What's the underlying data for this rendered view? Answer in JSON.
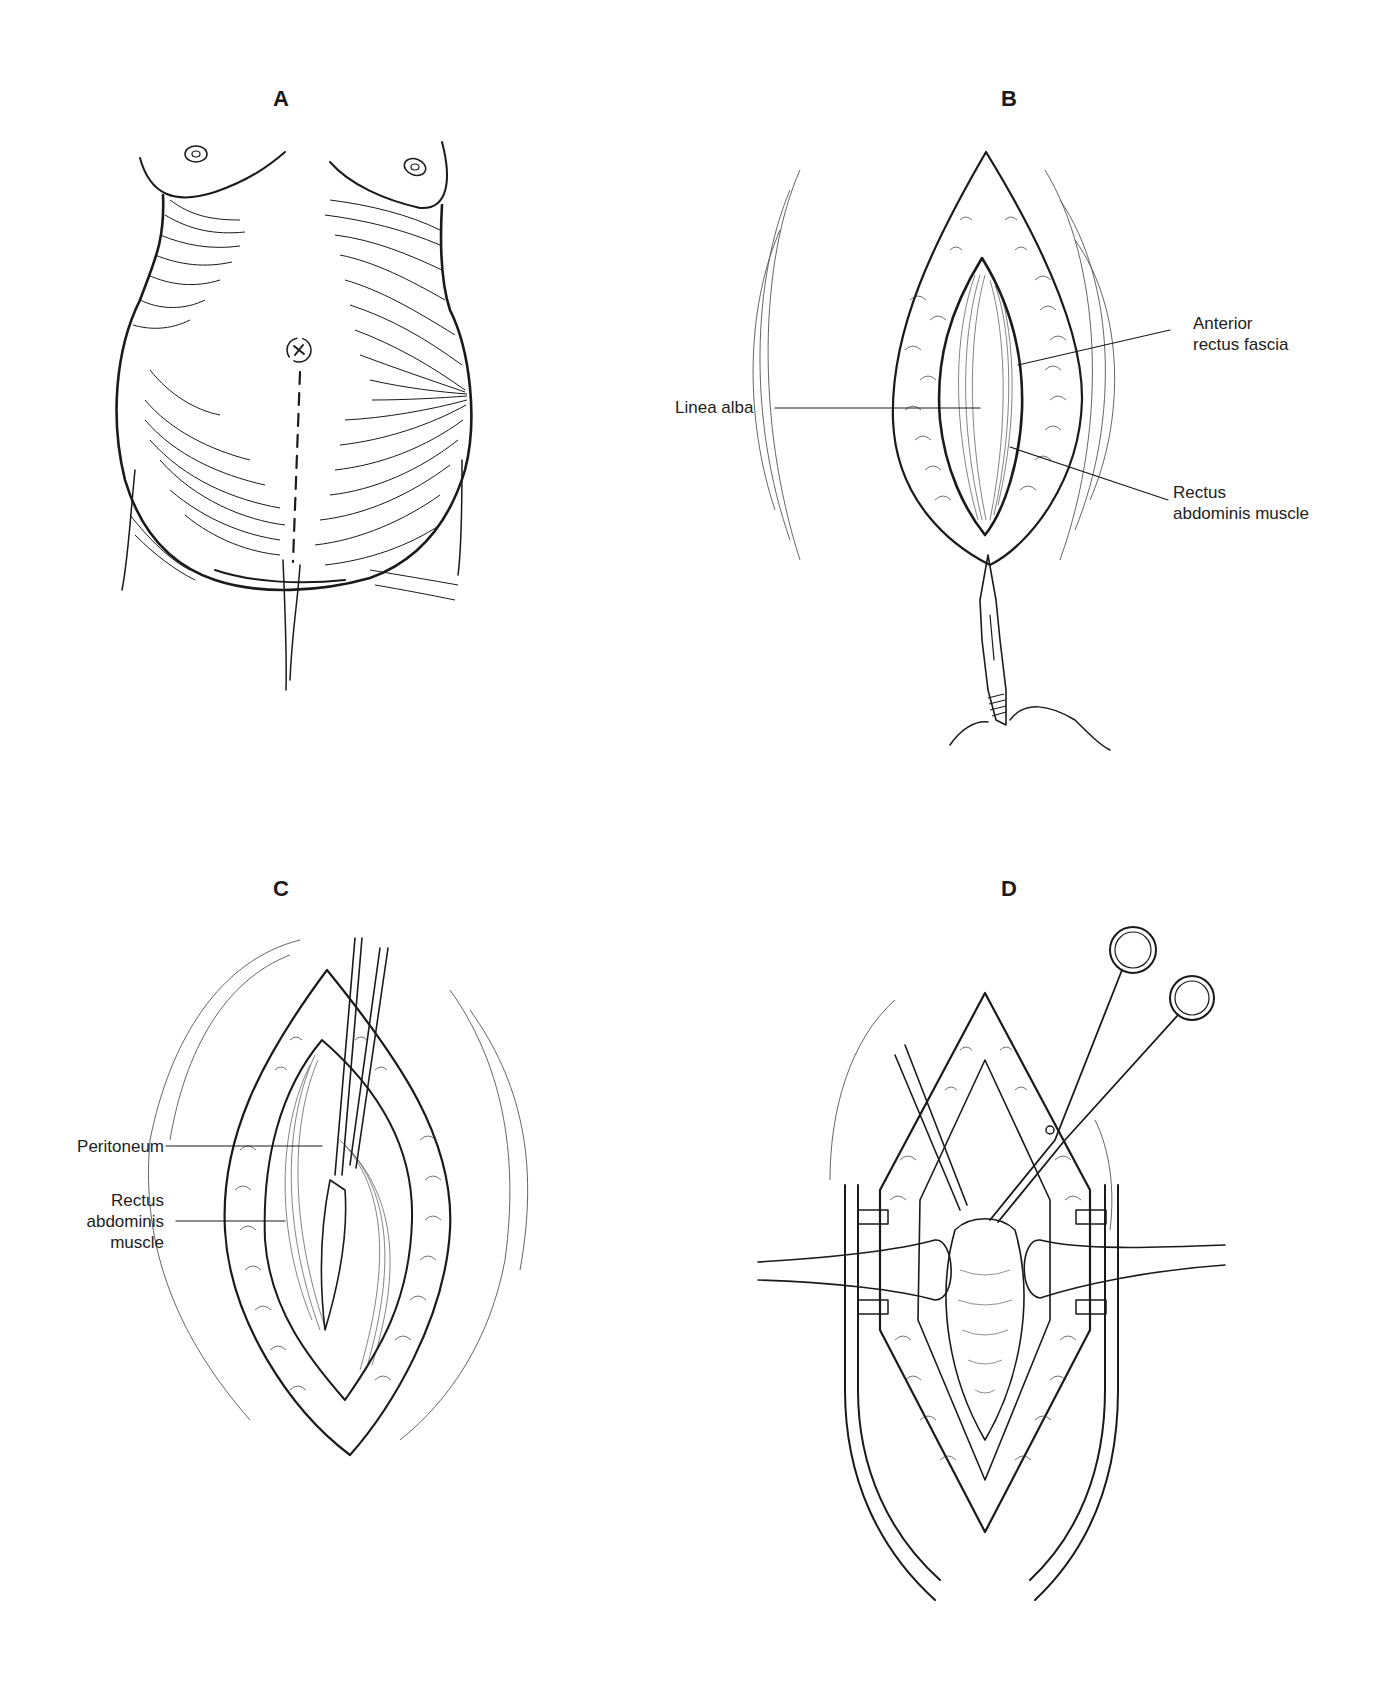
{
  "figure": {
    "panels": [
      {
        "id": "A",
        "letter": "A",
        "description": "Pregnant abdomen with dashed vertical midline incision line from umbilicus to pubis",
        "labels": []
      },
      {
        "id": "B",
        "letter": "B",
        "description": "Skin incision exposing fascia; scalpel incising linea alba",
        "labels": [
          {
            "text": "Linea alba"
          },
          {
            "line1": "Anterior",
            "line2": "rectus fascia"
          },
          {
            "line1": "Rectus",
            "line2": "abdominis muscle"
          }
        ]
      },
      {
        "id": "C",
        "letter": "C",
        "description": "Forceps elevating peritoneum between separated rectus muscles",
        "labels": [
          {
            "text": "Peritoneum"
          },
          {
            "line1": "Rectus",
            "line2": "abdominis",
            "line3": "muscle"
          }
        ]
      },
      {
        "id": "D",
        "letter": "D",
        "description": "Retractors in place; forceps and scissors opening peritoneum",
        "labels": []
      }
    ]
  }
}
